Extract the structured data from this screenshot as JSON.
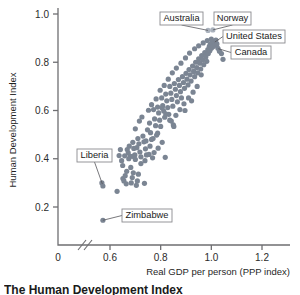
{
  "chart_data": {
    "type": "scatter",
    "title": "The Human Development Index",
    "xlabel": "Real GDP per person (PPP index)",
    "ylabel": "Human Development Index",
    "xlim": [
      0.52,
      1.3
    ],
    "ylim": [
      0.06,
      1.06
    ],
    "xticks": [
      0.6,
      0.8,
      1.0,
      1.2
    ],
    "xtick_labels": [
      "0.6",
      "0.8",
      "1.0",
      "1.2"
    ],
    "origin_tick_label": "0",
    "yticks": [
      0.2,
      0.4,
      0.6,
      0.8,
      1.0
    ],
    "ytick_labels": [
      "0.2",
      "0.4",
      "0.6",
      "0.8",
      "1.0"
    ],
    "grid": false,
    "legend": "none",
    "axis_break_x": true,
    "series": [
      {
        "name": "Countries",
        "color": "#7b8593",
        "points": [
          [
            0.568,
            0.3
          ],
          [
            0.572,
            0.287
          ],
          [
            0.572,
            0.145
          ],
          [
            0.628,
            0.265
          ],
          [
            0.636,
            0.413
          ],
          [
            0.641,
            0.438
          ],
          [
            0.646,
            0.392
          ],
          [
            0.651,
            0.318
          ],
          [
            0.655,
            0.308
          ],
          [
            0.66,
            0.33
          ],
          [
            0.664,
            0.296
          ],
          [
            0.668,
            0.438
          ],
          [
            0.672,
            0.424
          ],
          [
            0.676,
            0.452
          ],
          [
            0.68,
            0.41
          ],
          [
            0.684,
            0.3
          ],
          [
            0.688,
            0.322
          ],
          [
            0.69,
            0.468
          ],
          [
            0.694,
            0.443
          ],
          [
            0.698,
            0.416
          ],
          [
            0.7,
            0.397
          ],
          [
            0.704,
            0.29
          ],
          [
            0.708,
            0.308
          ],
          [
            0.71,
            0.484
          ],
          [
            0.714,
            0.462
          ],
          [
            0.718,
            0.428
          ],
          [
            0.722,
            0.408
          ],
          [
            0.726,
            0.573
          ],
          [
            0.73,
            0.494
          ],
          [
            0.734,
            0.47
          ],
          [
            0.736,
            0.298
          ],
          [
            0.74,
            0.441
          ],
          [
            0.744,
            0.416
          ],
          [
            0.748,
            0.52
          ],
          [
            0.752,
            0.601
          ],
          [
            0.756,
            0.548
          ],
          [
            0.76,
            0.508
          ],
          [
            0.764,
            0.48
          ],
          [
            0.768,
            0.404
          ],
          [
            0.772,
            0.604
          ],
          [
            0.776,
            0.565
          ],
          [
            0.78,
            0.537
          ],
          [
            0.784,
            0.498
          ],
          [
            0.788,
            0.614
          ],
          [
            0.792,
            0.59
          ],
          [
            0.796,
            0.56
          ],
          [
            0.8,
            0.534
          ],
          [
            0.804,
            0.652
          ],
          [
            0.808,
            0.62
          ],
          [
            0.812,
            0.598
          ],
          [
            0.816,
            0.572
          ],
          [
            0.818,
            0.406
          ],
          [
            0.82,
            0.668
          ],
          [
            0.824,
            0.64
          ],
          [
            0.828,
            0.612
          ],
          [
            0.832,
            0.584
          ],
          [
            0.836,
            0.7
          ],
          [
            0.84,
            0.672
          ],
          [
            0.844,
            0.646
          ],
          [
            0.848,
            0.618
          ],
          [
            0.85,
            0.54
          ],
          [
            0.854,
            0.712
          ],
          [
            0.858,
            0.688
          ],
          [
            0.862,
            0.662
          ],
          [
            0.866,
            0.636
          ],
          [
            0.87,
            0.728
          ],
          [
            0.874,
            0.704
          ],
          [
            0.878,
            0.678
          ],
          [
            0.882,
            0.652
          ],
          [
            0.886,
            0.74
          ],
          [
            0.89,
            0.716
          ],
          [
            0.894,
            0.692
          ],
          [
            0.896,
            0.6
          ],
          [
            0.9,
            0.754
          ],
          [
            0.904,
            0.73
          ],
          [
            0.908,
            0.706
          ],
          [
            0.912,
            0.77
          ],
          [
            0.916,
            0.748
          ],
          [
            0.92,
            0.722
          ],
          [
            0.922,
            0.64
          ],
          [
            0.926,
            0.784
          ],
          [
            0.93,
            0.762
          ],
          [
            0.934,
            0.74
          ],
          [
            0.938,
            0.8
          ],
          [
            0.942,
            0.778
          ],
          [
            0.946,
            0.756
          ],
          [
            0.95,
            0.814
          ],
          [
            0.954,
            0.796
          ],
          [
            0.958,
            0.772
          ],
          [
            0.962,
            0.828
          ],
          [
            0.966,
            0.81
          ],
          [
            0.97,
            0.79
          ],
          [
            0.974,
            0.84
          ],
          [
            0.978,
            0.822
          ],
          [
            0.982,
            0.804
          ],
          [
            0.986,
            0.852
          ],
          [
            0.988,
            0.836
          ],
          [
            0.992,
            0.866
          ],
          [
            0.994,
            0.848
          ],
          [
            0.996,
            0.874
          ],
          [
            1.0,
            0.858
          ],
          [
            1.002,
            0.88
          ],
          [
            1.006,
            0.864
          ],
          [
            1.01,
            0.886
          ],
          [
            1.014,
            0.87
          ],
          [
            1.018,
            0.892
          ],
          [
            1.022,
            0.876
          ],
          [
            1.026,
            0.858
          ],
          [
            1.032,
            0.846
          ],
          [
            1.04,
            0.836
          ],
          [
            1.046,
            0.812
          ],
          [
            0.96,
            0.748
          ],
          [
            0.944,
            0.7
          ],
          [
            0.928,
            0.676
          ],
          [
            0.91,
            0.652
          ],
          [
            0.892,
            0.628
          ],
          [
            0.876,
            0.604
          ],
          [
            0.86,
            0.58
          ],
          [
            0.842,
            0.556
          ],
          [
            0.806,
            0.468
          ],
          [
            0.79,
            0.444
          ],
          [
            0.774,
            0.426
          ],
          [
            0.758,
            0.452
          ],
          [
            0.742,
            0.474
          ],
          [
            0.716,
            0.556
          ],
          [
            0.7,
            0.524
          ],
          [
            0.682,
            0.364
          ],
          [
            0.666,
            0.348
          ],
          [
            0.65,
            0.372
          ],
          [
            0.692,
            0.342
          ],
          [
            0.712,
            0.336
          ],
          [
            0.764,
            0.624
          ],
          [
            0.782,
            0.648
          ],
          [
            0.798,
            0.684
          ],
          [
            0.814,
            0.704
          ],
          [
            0.83,
            0.73
          ],
          [
            0.846,
            0.756
          ],
          [
            0.862,
            0.776
          ],
          [
            0.88,
            0.796
          ],
          [
            0.898,
            0.818
          ],
          [
            0.914,
            0.838
          ],
          [
            0.934,
            0.856
          ],
          [
            0.95,
            0.868
          ],
          [
            0.968,
            0.88
          ],
          [
            0.984,
            0.89
          ],
          [
            1.0,
            0.896
          ],
          [
            0.852,
            0.534
          ],
          [
            0.836,
            0.56
          ],
          [
            0.82,
            0.586
          ],
          [
            0.806,
            0.61
          ],
          [
            0.788,
            0.506
          ],
          [
            0.77,
            0.484
          ],
          [
            0.754,
            0.418
          ],
          [
            0.738,
            0.392
          ],
          [
            0.722,
            0.38
          ],
          [
            0.706,
            0.446
          ],
          [
            0.69,
            0.41
          ],
          [
            0.674,
            0.4
          ],
          [
            0.658,
            0.412
          ]
        ]
      },
      {
        "name": "Highlighted",
        "color": "#aab2bd",
        "points": [
          [
            0.987,
            0.932
          ],
          [
            1.006,
            0.934
          ]
        ]
      }
    ],
    "annotations": [
      {
        "label": "Australia",
        "point": [
          0.987,
          0.932
        ],
        "box_x": 160,
        "box_y": 12,
        "box_w": 43,
        "box_h": 13
      },
      {
        "label": "Norway",
        "point": [
          1.006,
          0.934
        ],
        "box_x": 214,
        "box_y": 12,
        "box_w": 37,
        "box_h": 13
      },
      {
        "label": "United States",
        "point": [
          1.014,
          0.884
        ],
        "box_x": 223,
        "box_y": 30,
        "box_w": 62,
        "box_h": 13
      },
      {
        "label": "Canada",
        "point": [
          1.028,
          0.856
        ],
        "box_x": 231,
        "box_y": 46,
        "box_w": 40,
        "box_h": 13
      },
      {
        "label": "Liberia",
        "point": [
          0.57,
          0.295
        ],
        "box_x": 77,
        "box_y": 149,
        "box_w": 35,
        "box_h": 13
      },
      {
        "label": "Zimbabwe",
        "point": [
          0.572,
          0.145
        ],
        "box_x": 122,
        "box_y": 209,
        "box_w": 50,
        "box_h": 13
      }
    ]
  },
  "figure": {
    "caption": "The Human Development Index"
  }
}
